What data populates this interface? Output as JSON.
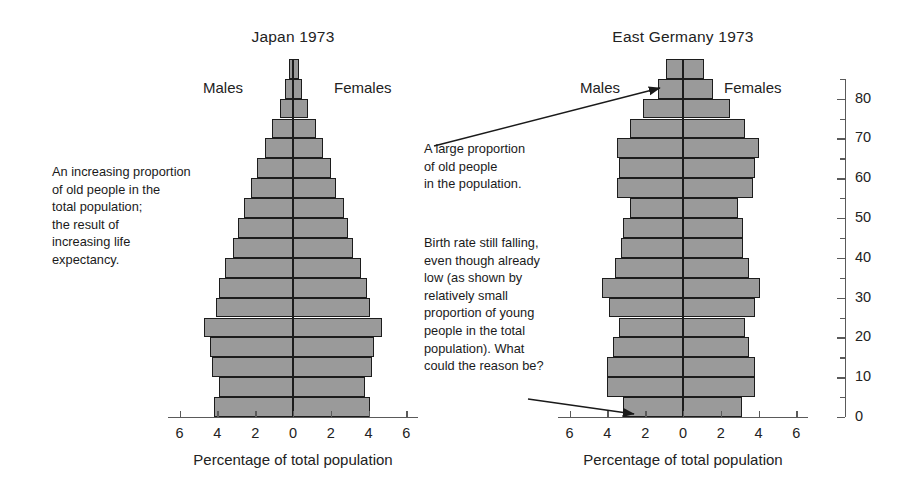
{
  "page": {
    "width": 911,
    "height": 504,
    "background": "#ffffff",
    "bar_fill": "#9a9a9a",
    "bar_stroke": "#1c1c1c",
    "axis_color": "#5a5a5a"
  },
  "panels": [
    {
      "id": "japan",
      "title": "Japan 1973",
      "males_label": "Males",
      "females_label": "Females",
      "axis_title": "Percentage of total population",
      "x_ticks": [
        "6",
        "4",
        "2",
        "0",
        "2",
        "4",
        "6"
      ]
    },
    {
      "id": "east-germany",
      "title": "East Germany 1973",
      "males_label": "Males",
      "females_label": "Females",
      "axis_title": "Percentage of total population",
      "x_ticks": [
        "6",
        "4",
        "2",
        "0",
        "2",
        "4",
        "6"
      ]
    }
  ],
  "age_axis": {
    "labels": [
      "80",
      "70",
      "60",
      "50",
      "40",
      "30",
      "20",
      "10",
      "0"
    ],
    "values": [
      80,
      70,
      60,
      50,
      40,
      30,
      20,
      10,
      0
    ],
    "minor_step": 5,
    "max": 85
  },
  "annotations": [
    {
      "id": "japan-note",
      "text": "An increasing proportion\nof old people in the\ntotal population;\nthe result of\nincreasing life\nexpectancy.",
      "has_arrow": false
    },
    {
      "id": "eg-old-note",
      "text": "A large proportion\nof old people\nin the population.",
      "has_arrow": true
    },
    {
      "id": "eg-birth-note",
      "text": "Birth rate still falling,\neven though already\nlow (as shown by\nrelatively small\nproportion of young\npeople in the total\npopulation). What\ncould the reason be?",
      "has_arrow": true
    }
  ],
  "chart_data": {
    "type": "bar",
    "subtype": "population-pyramid",
    "xlabel": "Percentage of total population",
    "ylabel": "Age (years)",
    "xlim": [
      -6.5,
      6.5
    ],
    "ylim": [
      0,
      85
    ],
    "grid": false,
    "legend_position": "inline-top",
    "age_groups": [
      "0-4",
      "5-9",
      "10-14",
      "15-19",
      "20-24",
      "25-29",
      "30-34",
      "35-39",
      "40-44",
      "45-49",
      "50-54",
      "55-59",
      "60-64",
      "65-69",
      "70-74",
      "75-79",
      "80-84",
      "85+"
    ],
    "panels": [
      {
        "name": "Japan 1973",
        "center_tick": "0",
        "series": [
          {
            "name": "Males",
            "side": "left",
            "values": [
              4.2,
              3.9,
              4.3,
              4.4,
              4.7,
              4.1,
              3.9,
              3.6,
              3.2,
              2.9,
              2.6,
              2.2,
              1.9,
              1.5,
              1.1,
              0.7,
              0.4,
              0.2
            ]
          },
          {
            "name": "Females",
            "side": "right",
            "values": [
              4.1,
              3.8,
              4.2,
              4.3,
              4.7,
              4.1,
              3.9,
              3.6,
              3.2,
              2.9,
              2.7,
              2.3,
              2.0,
              1.6,
              1.2,
              0.8,
              0.5,
              0.3
            ]
          }
        ]
      },
      {
        "name": "East Germany 1973",
        "center_tick": "0",
        "series": [
          {
            "name": "Males",
            "side": "left",
            "values": [
              3.2,
              4.0,
              4.0,
              3.7,
              3.4,
              3.9,
              4.3,
              3.6,
              3.3,
              3.2,
              2.8,
              3.5,
              3.4,
              3.5,
              2.8,
              2.1,
              1.3,
              0.9
            ]
          },
          {
            "name": "Females",
            "side": "right",
            "values": [
              3.1,
              3.8,
              3.8,
              3.5,
              3.3,
              3.8,
              4.1,
              3.5,
              3.2,
              3.2,
              2.9,
              3.7,
              3.8,
              4.0,
              3.3,
              2.5,
              1.6,
              1.1
            ]
          }
        ]
      }
    ]
  }
}
